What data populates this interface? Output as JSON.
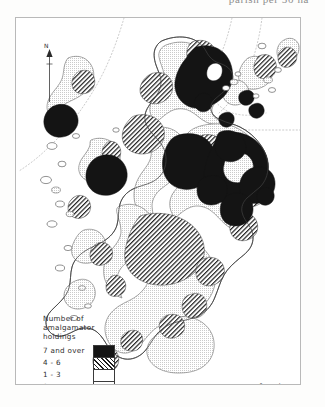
{
  "page": {
    "cut_off_text": "parish  per  50 ha",
    "background_color": "#fdfdfc"
  },
  "map": {
    "title": "",
    "region": "Scotland",
    "frame_color": "#b9b9b9",
    "coast_color": "#4a4a4a",
    "graticule_style": "dotted",
    "north_arrow": {
      "label": "N",
      "icon": "north-arrow-icon"
    }
  },
  "legend": {
    "title": "Number of\namalgamator\nholdings",
    "classes": [
      {
        "label": "7 and over",
        "pattern": "black",
        "color": "#151515"
      },
      {
        "label": "4 - 6",
        "pattern": "hatch",
        "color": "#1e1e1e"
      },
      {
        "label": "1 - 3",
        "pattern": "stipple",
        "color": "#6d6d6d"
      },
      {
        "label": "0",
        "pattern": "white",
        "color": "#ffffff"
      }
    ]
  },
  "scale_bar": {
    "min_label": "0",
    "unit_label": "km",
    "max_label": "50"
  }
}
